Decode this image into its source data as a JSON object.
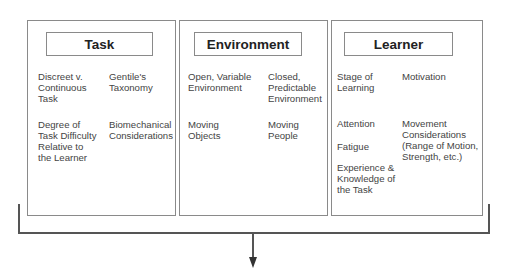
{
  "diagram": {
    "panels": [
      {
        "title": "Task",
        "items": [
          {
            "text": "Discreet v.\nContinuous\nTask"
          },
          {
            "text": "Gentile's\nTaxonomy"
          },
          {
            "text": "Degree of\nTask Difficulty\nRelative to\nthe Learner"
          },
          {
            "text": "Biomechanical\nConsiderations"
          }
        ]
      },
      {
        "title": "Environment",
        "items": [
          {
            "text": "Open, Variable\nEnvironment"
          },
          {
            "text": "Closed,\nPredictable\nEnvironment"
          },
          {
            "text": "Moving\nObjects"
          },
          {
            "text": "Moving\nPeople"
          }
        ]
      },
      {
        "title": "Learner",
        "items": [
          {
            "text": "Stage of\nLearning"
          },
          {
            "text": "Motivation"
          },
          {
            "text": "Attention"
          },
          {
            "text": "Movement\nConsiderations\n(Range of Motion,\nStrength, etc.)"
          },
          {
            "text": "Fatigue"
          },
          {
            "text": "Experience &\nKnowledge of\nthe Task"
          }
        ]
      }
    ],
    "connector": {
      "type": "bracket-with-down-arrow"
    }
  }
}
